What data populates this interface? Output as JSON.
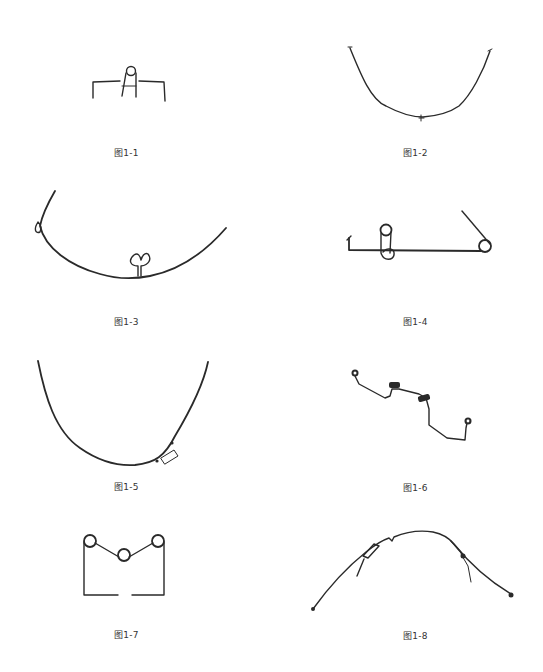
{
  "figures": [
    {
      "id": 1,
      "caption": "图1-1",
      "subject": "wire appliance with single loop and two vertical legs"
    },
    {
      "id": 2,
      "caption": "图1-2",
      "subject": "U-shaped arch wire"
    },
    {
      "id": 3,
      "caption": "图1-3",
      "subject": "arch wire with triangular loop"
    },
    {
      "id": 4,
      "caption": "图1-4",
      "subject": "straight wire with coil loops"
    },
    {
      "id": 5,
      "caption": "图1-5",
      "subject": "U-shaped arch wire with sleeve"
    },
    {
      "id": 6,
      "caption": "图1-6",
      "subject": "stepped wire with coil springs"
    },
    {
      "id": 7,
      "caption": "图1-7",
      "subject": "M-shaped wire with three loops"
    },
    {
      "id": 8,
      "caption": "图1-8",
      "subject": "arched wire with attachments"
    }
  ],
  "colors": {
    "background": "#ffffff",
    "wire": "#2a2a2a",
    "caption_text": "#333333"
  }
}
